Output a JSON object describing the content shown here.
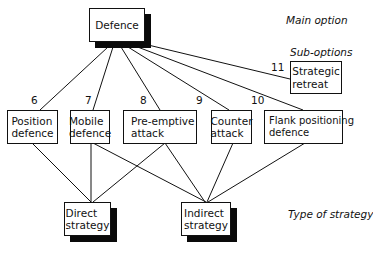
{
  "diagram": {
    "levels": {
      "main": "Main option",
      "sub": "Sub-options",
      "strategy": "Type of strategy"
    },
    "main_option": {
      "label": "Defence"
    },
    "sub_options": [
      {
        "number": "6",
        "line1": "Position",
        "line2": "defence"
      },
      {
        "number": "7",
        "line1": "Mobile",
        "line2": "defence"
      },
      {
        "number": "8",
        "line1": "Pre-emptive",
        "line2": "attack"
      },
      {
        "number": "9",
        "line1": "Counter",
        "line2": "attack"
      },
      {
        "number": "10",
        "line1": "Flank positioning",
        "line2": "defence"
      },
      {
        "number": "11",
        "line1": "Strategic",
        "line2": "retreat"
      }
    ],
    "strategies": [
      {
        "line1": "Direct",
        "line2": "strategy"
      },
      {
        "line1": "Indirect",
        "line2": "strategy"
      }
    ],
    "edges": [
      {
        "from": "Defence",
        "to": "Position defence"
      },
      {
        "from": "Defence",
        "to": "Mobile defence"
      },
      {
        "from": "Defence",
        "to": "Pre-emptive attack"
      },
      {
        "from": "Defence",
        "to": "Counter attack"
      },
      {
        "from": "Defence",
        "to": "Flank positioning defence"
      },
      {
        "from": "Defence",
        "to": "Strategic retreat"
      },
      {
        "from": "Position defence",
        "to": "Direct strategy"
      },
      {
        "from": "Mobile defence",
        "to": "Direct strategy"
      },
      {
        "from": "Mobile defence",
        "to": "Indirect strategy"
      },
      {
        "from": "Pre-emptive attack",
        "to": "Direct strategy"
      },
      {
        "from": "Pre-emptive attack",
        "to": "Indirect strategy"
      },
      {
        "from": "Counter attack",
        "to": "Indirect strategy"
      },
      {
        "from": "Flank positioning defence",
        "to": "Indirect strategy"
      }
    ]
  }
}
